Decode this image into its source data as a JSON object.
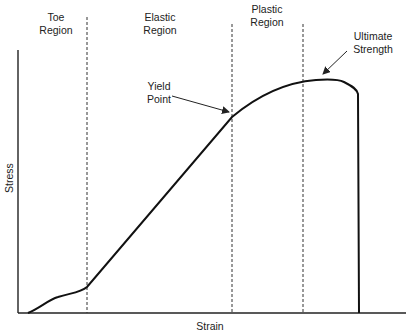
{
  "diagram": {
    "axes": {
      "x_label": "Strain",
      "y_label": "Stress"
    },
    "regions": [
      {
        "line1": "Toe",
        "line2": "Region"
      },
      {
        "line1": "Elastic",
        "line2": "Region"
      },
      {
        "line1": "Plastic",
        "line2": "Region"
      }
    ],
    "annotations": {
      "yield_point": {
        "line1": "Yield",
        "line2": "Point"
      },
      "ultimate_strength": {
        "line1": "Ultimate",
        "line2": "Strength"
      }
    },
    "colors": {
      "curve": "#111111",
      "axes": "#222222",
      "dashed": "#333333"
    }
  }
}
